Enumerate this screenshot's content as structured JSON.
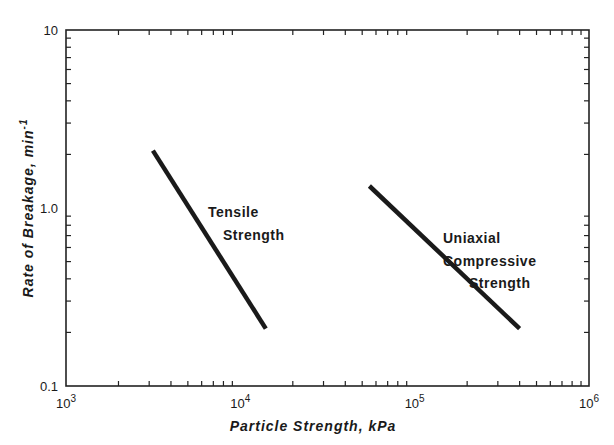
{
  "chart_data": {
    "type": "line",
    "title": "",
    "xlabel": "Particle Strength,   kPa",
    "ylabel": "Rate of Breakage,   min",
    "ylabel_superscript": "-1",
    "xscale": "log",
    "yscale": "log",
    "xlim": [
      1000,
      1000000
    ],
    "ylim": [
      0.1,
      10
    ],
    "grid": false,
    "legend": "none",
    "x_ticks": [
      {
        "value": 1000,
        "base": "10",
        "exp": "3"
      },
      {
        "value": 10000,
        "base": "10",
        "exp": "4"
      },
      {
        "value": 100000,
        "base": "10",
        "exp": "5"
      },
      {
        "value": 1000000,
        "base": "10",
        "exp": "6"
      }
    ],
    "y_ticks": [
      {
        "value": 0.1,
        "label": "0.1"
      },
      {
        "value": 1.0,
        "label": "1.0"
      },
      {
        "value": 10,
        "label": "10"
      }
    ],
    "series": [
      {
        "name": "Tensile Strength",
        "label_lines": [
          "Tensile",
          "Strength"
        ],
        "x": [
          3150,
          14000
        ],
        "y": [
          2.1,
          0.21
        ]
      },
      {
        "name": "Uniaxial Compressive Strength",
        "label_lines": [
          "Uniaxial",
          "Compressive",
          "Strength"
        ],
        "x": [
          55000,
          400000
        ],
        "y": [
          1.33,
          0.21
        ]
      }
    ]
  },
  "colors": {
    "line": "#1a1a1a",
    "axis": "#222222",
    "background": "#ffffff"
  }
}
